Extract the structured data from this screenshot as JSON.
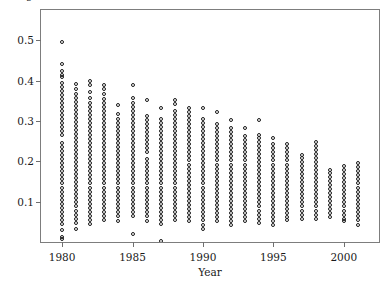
{
  "figure": {
    "clipped_top_label": "p",
    "background_color": "#ffffff",
    "frame_color": "#7d7d7d",
    "marker_color": "#191919"
  },
  "chart_data": {
    "type": "scatter",
    "title": "",
    "xlabel": "Year",
    "ylabel": "",
    "xlim": [
      1978.5,
      2002.5
    ],
    "ylim": [
      0.0,
      0.575
    ],
    "grid": false,
    "legend": null,
    "marker": "open-circle",
    "xticks": [
      1980,
      1985,
      1990,
      1995,
      2000
    ],
    "xticklabels": [
      "1980",
      "1985",
      "1990",
      "1995",
      "2000"
    ],
    "yticks": [
      0.1,
      0.2,
      0.3,
      0.4,
      0.5
    ],
    "yticklabels": [
      "0.1",
      "0.2",
      "0.3",
      "0.4",
      "0.5"
    ],
    "series": [
      {
        "name": "observations",
        "x": 1980,
        "values": [
          0.495,
          0.44,
          0.425,
          0.415,
          0.41,
          0.395,
          0.385,
          0.375,
          0.365,
          0.355,
          0.345,
          0.335,
          0.325,
          0.315,
          0.305,
          0.295,
          0.285,
          0.275,
          0.265,
          0.245,
          0.235,
          0.225,
          0.215,
          0.205,
          0.195,
          0.185,
          0.175,
          0.165,
          0.155,
          0.145,
          0.135,
          0.125,
          0.115,
          0.105,
          0.095,
          0.085,
          0.075,
          0.065,
          0.055,
          0.045,
          0.03,
          0.012,
          0.008
        ]
      },
      {
        "name": "observations",
        "x": 1981,
        "values": [
          0.392,
          0.378,
          0.368,
          0.358,
          0.348,
          0.338,
          0.328,
          0.318,
          0.308,
          0.298,
          0.288,
          0.278,
          0.268,
          0.258,
          0.248,
          0.238,
          0.228,
          0.218,
          0.208,
          0.198,
          0.188,
          0.178,
          0.168,
          0.158,
          0.148,
          0.138,
          0.128,
          0.118,
          0.108,
          0.098,
          0.088,
          0.078,
          0.068,
          0.058,
          0.048,
          0.032
        ]
      },
      {
        "name": "observations",
        "x": 1982,
        "values": [
          0.398,
          0.388,
          0.372,
          0.358,
          0.345,
          0.335,
          0.325,
          0.315,
          0.305,
          0.295,
          0.285,
          0.275,
          0.265,
          0.255,
          0.245,
          0.235,
          0.225,
          0.215,
          0.205,
          0.195,
          0.185,
          0.175,
          0.165,
          0.155,
          0.145,
          0.135,
          0.125,
          0.115,
          0.105,
          0.095,
          0.085,
          0.075,
          0.065,
          0.055,
          0.045
        ]
      },
      {
        "name": "observations",
        "x": 1983,
        "values": [
          0.388,
          0.378,
          0.368,
          0.355,
          0.345,
          0.335,
          0.325,
          0.315,
          0.305,
          0.295,
          0.285,
          0.275,
          0.265,
          0.255,
          0.245,
          0.235,
          0.225,
          0.215,
          0.205,
          0.195,
          0.185,
          0.175,
          0.165,
          0.155,
          0.145,
          0.135,
          0.125,
          0.115,
          0.105,
          0.095,
          0.085,
          0.075,
          0.065,
          0.055
        ]
      },
      {
        "name": "observations",
        "x": 1984,
        "values": [
          0.34,
          0.318,
          0.305,
          0.295,
          0.285,
          0.275,
          0.265,
          0.255,
          0.245,
          0.235,
          0.225,
          0.215,
          0.205,
          0.195,
          0.185,
          0.175,
          0.165,
          0.155,
          0.145,
          0.135,
          0.125,
          0.115,
          0.105,
          0.095,
          0.085,
          0.075,
          0.065,
          0.052
        ]
      },
      {
        "name": "observations",
        "x": 1985,
        "values": [
          0.39,
          0.358,
          0.345,
          0.335,
          0.325,
          0.315,
          0.305,
          0.295,
          0.285,
          0.275,
          0.265,
          0.255,
          0.245,
          0.235,
          0.225,
          0.215,
          0.205,
          0.195,
          0.185,
          0.175,
          0.165,
          0.155,
          0.145,
          0.135,
          0.125,
          0.115,
          0.105,
          0.095,
          0.085,
          0.075,
          0.065,
          0.02
        ]
      },
      {
        "name": "observations",
        "x": 1986,
        "values": [
          0.352,
          0.312,
          0.302,
          0.292,
          0.282,
          0.272,
          0.262,
          0.252,
          0.242,
          0.232,
          0.222,
          0.205,
          0.195,
          0.185,
          0.175,
          0.165,
          0.155,
          0.145,
          0.135,
          0.125,
          0.115,
          0.105,
          0.095,
          0.085,
          0.075,
          0.065,
          0.052
        ]
      },
      {
        "name": "observations",
        "x": 1987,
        "values": [
          0.332,
          0.305,
          0.295,
          0.285,
          0.275,
          0.265,
          0.255,
          0.245,
          0.235,
          0.225,
          0.215,
          0.205,
          0.195,
          0.185,
          0.175,
          0.165,
          0.155,
          0.145,
          0.135,
          0.125,
          0.115,
          0.105,
          0.095,
          0.085,
          0.075,
          0.065,
          0.055,
          0.045,
          0.002
        ]
      },
      {
        "name": "observations",
        "x": 1988,
        "values": [
          0.352,
          0.342,
          0.325,
          0.315,
          0.305,
          0.295,
          0.285,
          0.275,
          0.265,
          0.255,
          0.245,
          0.235,
          0.225,
          0.215,
          0.205,
          0.195,
          0.185,
          0.175,
          0.165,
          0.155,
          0.145,
          0.135,
          0.125,
          0.115,
          0.105,
          0.095,
          0.085,
          0.075,
          0.065,
          0.055
        ]
      },
      {
        "name": "observations",
        "x": 1989,
        "values": [
          0.332,
          0.322,
          0.312,
          0.302,
          0.292,
          0.282,
          0.272,
          0.262,
          0.252,
          0.242,
          0.232,
          0.222,
          0.212,
          0.202,
          0.192,
          0.182,
          0.172,
          0.162,
          0.152,
          0.142,
          0.132,
          0.122,
          0.112,
          0.102,
          0.092,
          0.082,
          0.072,
          0.062,
          0.052
        ]
      },
      {
        "name": "observations",
        "x": 1990,
        "values": [
          0.332,
          0.305,
          0.295,
          0.285,
          0.275,
          0.265,
          0.255,
          0.245,
          0.235,
          0.225,
          0.215,
          0.205,
          0.195,
          0.185,
          0.175,
          0.165,
          0.155,
          0.145,
          0.135,
          0.125,
          0.115,
          0.105,
          0.095,
          0.085,
          0.075,
          0.065,
          0.055,
          0.042,
          0.032
        ]
      },
      {
        "name": "observations",
        "x": 1991,
        "values": [
          0.322,
          0.292,
          0.282,
          0.272,
          0.262,
          0.252,
          0.242,
          0.232,
          0.222,
          0.212,
          0.202,
          0.192,
          0.182,
          0.172,
          0.162,
          0.152,
          0.142,
          0.132,
          0.122,
          0.112,
          0.102,
          0.092,
          0.082,
          0.072,
          0.062,
          0.052
        ]
      },
      {
        "name": "observations",
        "x": 1992,
        "values": [
          0.302,
          0.282,
          0.272,
          0.262,
          0.252,
          0.242,
          0.232,
          0.222,
          0.212,
          0.202,
          0.192,
          0.182,
          0.172,
          0.162,
          0.152,
          0.142,
          0.132,
          0.122,
          0.112,
          0.102,
          0.092,
          0.082,
          0.072,
          0.062,
          0.052,
          0.042
        ]
      },
      {
        "name": "observations",
        "x": 1993,
        "values": [
          0.282,
          0.262,
          0.252,
          0.242,
          0.232,
          0.222,
          0.212,
          0.202,
          0.192,
          0.182,
          0.172,
          0.162,
          0.152,
          0.142,
          0.132,
          0.122,
          0.112,
          0.102,
          0.092,
          0.082,
          0.072,
          0.062,
          0.052
        ]
      },
      {
        "name": "observations",
        "x": 1994,
        "values": [
          0.302,
          0.265,
          0.258,
          0.248,
          0.238,
          0.228,
          0.218,
          0.208,
          0.198,
          0.188,
          0.178,
          0.168,
          0.158,
          0.148,
          0.138,
          0.128,
          0.118,
          0.108,
          0.098,
          0.088,
          0.078,
          0.068,
          0.058,
          0.048
        ]
      },
      {
        "name": "observations",
        "x": 1995,
        "values": [
          0.258,
          0.242,
          0.232,
          0.222,
          0.212,
          0.202,
          0.192,
          0.182,
          0.172,
          0.162,
          0.152,
          0.142,
          0.132,
          0.122,
          0.112,
          0.102,
          0.092,
          0.082,
          0.072,
          0.062,
          0.052,
          0.042
        ]
      },
      {
        "name": "observations",
        "x": 1996,
        "values": [
          0.242,
          0.232,
          0.222,
          0.212,
          0.202,
          0.192,
          0.182,
          0.172,
          0.162,
          0.152,
          0.142,
          0.132,
          0.122,
          0.112,
          0.102,
          0.092,
          0.082,
          0.072,
          0.062,
          0.055
        ]
      },
      {
        "name": "observations",
        "x": 1997,
        "values": [
          0.215,
          0.208,
          0.198,
          0.188,
          0.178,
          0.168,
          0.158,
          0.148,
          0.138,
          0.128,
          0.118,
          0.108,
          0.098,
          0.088,
          0.078,
          0.068,
          0.058
        ]
      },
      {
        "name": "observations",
        "x": 1998,
        "values": [
          0.248,
          0.238,
          0.228,
          0.218,
          0.208,
          0.198,
          0.188,
          0.178,
          0.168,
          0.158,
          0.148,
          0.138,
          0.128,
          0.118,
          0.108,
          0.098,
          0.088,
          0.078,
          0.068,
          0.058
        ]
      },
      {
        "name": "observations",
        "x": 1999,
        "values": [
          0.178,
          0.172,
          0.162,
          0.152,
          0.142,
          0.132,
          0.122,
          0.112,
          0.102,
          0.092,
          0.082,
          0.072,
          0.062
        ]
      },
      {
        "name": "observations",
        "x": 2000,
        "values": [
          0.188,
          0.178,
          0.168,
          0.158,
          0.148,
          0.138,
          0.128,
          0.118,
          0.108,
          0.098,
          0.088,
          0.078,
          0.068,
          0.058,
          0.052
        ]
      },
      {
        "name": "observations",
        "x": 2001,
        "values": [
          0.195,
          0.185,
          0.175,
          0.165,
          0.155,
          0.145,
          0.135,
          0.125,
          0.115,
          0.105,
          0.095,
          0.085,
          0.075,
          0.065,
          0.055,
          0.042
        ]
      }
    ]
  }
}
